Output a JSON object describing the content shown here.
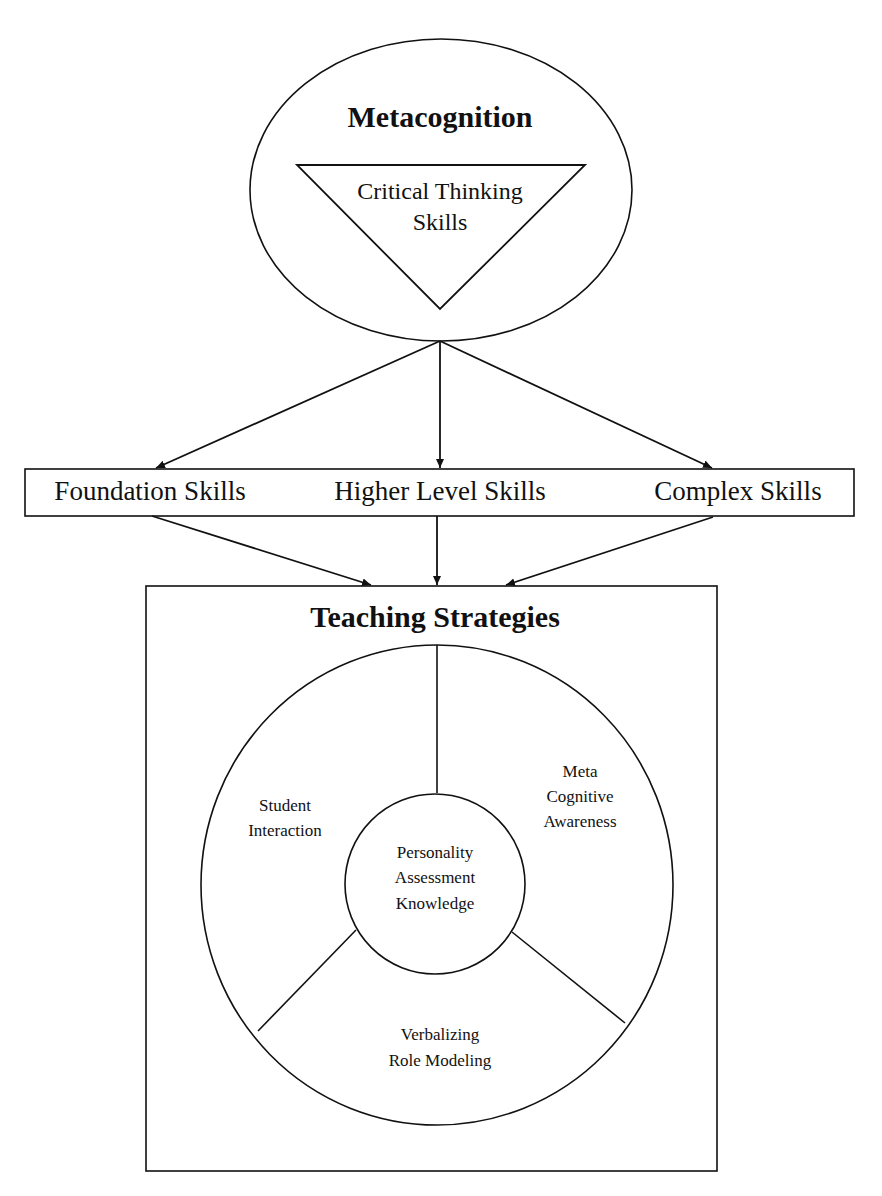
{
  "diagram": {
    "top": {
      "title": "Metacognition",
      "triangle_label_line1": "Critical Thinking",
      "triangle_label_line2": "Skills"
    },
    "skills_bar": {
      "items": [
        "Foundation Skills",
        "Higher Level Skills",
        "Complex Skills"
      ]
    },
    "teaching": {
      "title": "Teaching Strategies",
      "center": [
        "Personality",
        "Assessment",
        "Knowledge"
      ],
      "segments": {
        "left": [
          "Student",
          "Interaction"
        ],
        "right": [
          "Meta",
          "Cognitive",
          "Awareness"
        ],
        "bottom": [
          "Verbalizing",
          "Role Modeling"
        ]
      }
    },
    "colors": {
      "stroke": "#111111",
      "background": "#ffffff"
    }
  }
}
